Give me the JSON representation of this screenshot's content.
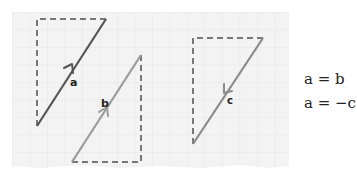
{
  "diagram": {
    "type": "vector-equality",
    "paper": {
      "x": 12,
      "y": 12,
      "width": 277,
      "height": 156,
      "grid_spacing": 17.5,
      "background": "#f4f4f4",
      "grid_color": "#e0e0e0"
    },
    "vectors": [
      {
        "label": "a",
        "from": [
          37,
          126
        ],
        "to": [
          106,
          19
        ],
        "arrow_at": [
          71,
          71
        ],
        "direction": "up-right",
        "color": "#555555",
        "dashed_box": {
          "corner": [
            37,
            19
          ],
          "horizontal_to": 106,
          "vertical_to": 126
        }
      },
      {
        "label": "b",
        "from": [
          72,
          162
        ],
        "to": [
          141,
          55
        ],
        "arrow_at": [
          106,
          108
        ],
        "direction": "up-right",
        "color": "#9a9a9a",
        "dashed_box": {
          "corner": [
            141,
            162
          ],
          "horizontal_to": 72,
          "vertical_to": 55
        }
      },
      {
        "label": "c",
        "from": [
          263,
          38
        ],
        "to": [
          193,
          144
        ],
        "arrow_at": [
          228,
          91
        ],
        "direction": "down-left",
        "color": "#8a8a8a",
        "dashed_box": {
          "corner": [
            193,
            38
          ],
          "horizontal_to": 263,
          "vertical_to": 144
        }
      }
    ],
    "labels": {
      "a": "a",
      "b": "b",
      "c": "c"
    },
    "dash_color": "#777777"
  },
  "equations": [
    "a = b",
    "a = −c"
  ]
}
